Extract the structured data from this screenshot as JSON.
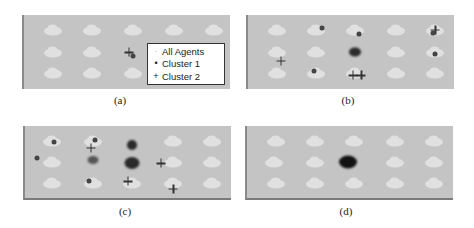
{
  "figure": {
    "panels": [
      {
        "id": "a",
        "caption": "(a)"
      },
      {
        "id": "b",
        "caption": "(b)"
      },
      {
        "id": "c",
        "caption": "(c)"
      },
      {
        "id": "d",
        "caption": "(d)"
      }
    ],
    "legend": {
      "items": [
        {
          "label": "All Agents",
          "symbol": "·"
        },
        {
          "label": "Cluster 1",
          "symbol": "•"
        },
        {
          "label": "Cluster 2",
          "symbol": "+"
        }
      ]
    },
    "colors": {
      "background": "#c4c4c4",
      "agent": "#e6e6e6",
      "marker": "#333333",
      "frame": "#8a8a8a"
    },
    "grid": {
      "columns": 5,
      "rows": 3
    }
  }
}
